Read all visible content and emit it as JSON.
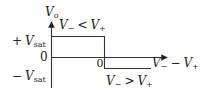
{
  "diagram": {
    "type": "comparator-transfer-characteristic",
    "y_axis": {
      "label_main": "V",
      "label_sub": "o"
    },
    "x_axis": {
      "label": "V₋ − V₊",
      "label_parts": {
        "a": "V",
        "a_sub": "−",
        "op": "−",
        "b": "V",
        "b_sub": "+"
      }
    },
    "y_ticks": [
      {
        "sign": "+",
        "main": "V",
        "sub": "sat"
      },
      {
        "text": "0"
      },
      {
        "sign": "−",
        "main": "V",
        "sub": "sat"
      }
    ],
    "x_origin_label": "0",
    "regions": [
      {
        "condition": "V₋ < V₊",
        "a": "V",
        "a_sub": "−",
        "op": "<",
        "b": "V",
        "b_sub": "+",
        "level": "+Vsat"
      },
      {
        "condition": "V₋ > V₊",
        "a": "V",
        "a_sub": "−",
        "op": ">",
        "b": "V",
        "b_sub": "+",
        "level": "-Vsat"
      }
    ],
    "line_color": "#333333"
  }
}
